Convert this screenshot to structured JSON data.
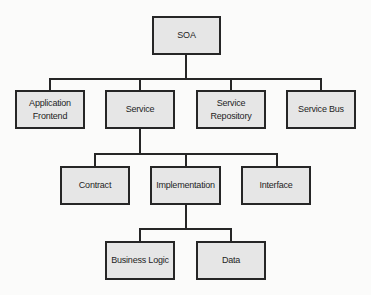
{
  "diagram": {
    "colors": {
      "node_fill": "#e6e6e6",
      "node_border": "#262626",
      "connector": "#262626",
      "background": "#fbfbfa"
    },
    "nodes": {
      "soa": {
        "label": "SOA"
      },
      "application_frontend": {
        "label": "Application\nFrontend"
      },
      "service": {
        "label": "Service"
      },
      "service_repository": {
        "label": "Service\nRepository"
      },
      "service_bus": {
        "label": "Service Bus"
      },
      "contract": {
        "label": "Contract"
      },
      "implementation": {
        "label": "Implementation"
      },
      "interface": {
        "label": "Interface"
      },
      "business_logic": {
        "label": "Business Logic"
      },
      "data": {
        "label": "Data"
      }
    },
    "edges": [
      {
        "from": "SOA",
        "to": "Application Frontend"
      },
      {
        "from": "SOA",
        "to": "Service"
      },
      {
        "from": "SOA",
        "to": "Service Repository"
      },
      {
        "from": "SOA",
        "to": "Service Bus"
      },
      {
        "from": "Service",
        "to": "Contract"
      },
      {
        "from": "Service",
        "to": "Implementation"
      },
      {
        "from": "Service",
        "to": "Interface"
      },
      {
        "from": "Implementation",
        "to": "Business Logic"
      },
      {
        "from": "Implementation",
        "to": "Data"
      }
    ]
  }
}
